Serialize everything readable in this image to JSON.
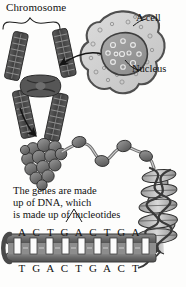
{
  "diagram": {
    "style": "grayscale biology textbook illustration",
    "background_color": "#fdfdfc",
    "ink_color": "#1a1a1a"
  },
  "labels": {
    "chromosome": "Chromosome",
    "cell": "A cell",
    "nucleus": "Nucleus"
  },
  "caption": {
    "line1": "The genes are made",
    "line2": "up of DNA, which",
    "line3": "is made up of nucleotides"
  },
  "dna": {
    "top_strand": [
      "A",
      "C",
      "T",
      "G",
      "A",
      "C",
      "T",
      "G",
      "A"
    ],
    "bottom_strand": [
      "T",
      "G",
      "A",
      "C",
      "T",
      "G",
      "A",
      "C",
      "T"
    ],
    "rung_count": 9,
    "backbone_color": "#6e6e6e",
    "rung_color": "#ffffff"
  },
  "parts": {
    "chromosome_arms": 4,
    "chromosome_bands_per_arm": 8,
    "nucleosome_cluster_beads": 14,
    "beaded_chain_beads": 4,
    "helix_turns": 5,
    "nucleus_circles": 11
  },
  "colors": {
    "cell_cytoplasm": "#cfcfcf",
    "cell_membrane": "#5a5a5a",
    "nucleus_fill": "#9a9a9a",
    "nucleus_outline": "#4a4a4a",
    "chromosome_dark": "#4a4a4a",
    "chromosome_mid": "#6a6a6a",
    "bead_fill": "#6b6b6b",
    "helix_fill": "#b8b8b8"
  }
}
